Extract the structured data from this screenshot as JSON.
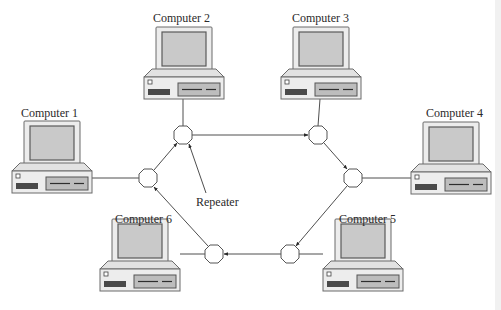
{
  "diagram": {
    "type": "ring-network",
    "computers": [
      {
        "id": 1,
        "label": "Computer 1",
        "x": 12,
        "y": 121,
        "label_x": 50,
        "label_y": 116
      },
      {
        "id": 2,
        "label": "Computer 2",
        "x": 144,
        "y": 27,
        "label_x": 184,
        "label_y": 21
      },
      {
        "id": 3,
        "label": "Computer 3",
        "x": 281,
        "y": 27,
        "label_x": 321,
        "label_y": 21
      },
      {
        "id": 4,
        "label": "Computer 4",
        "x": 411,
        "y": 122,
        "label_x": 451,
        "label_y": 116
      },
      {
        "id": 5,
        "label": "Computer 5",
        "x": 323,
        "y": 219,
        "label_x": 363,
        "label_y": 213
      },
      {
        "id": 6,
        "label": "Computer 6",
        "x": 100,
        "y": 219,
        "label_x": 140,
        "label_y": 213
      }
    ],
    "repeaters": [
      {
        "id": "R1",
        "cx": 148,
        "cy": 178
      },
      {
        "id": "R2",
        "cx": 183,
        "cy": 135
      },
      {
        "id": "R3",
        "cx": 318,
        "cy": 135
      },
      {
        "id": "R4",
        "cx": 353,
        "cy": 178
      },
      {
        "id": "R5",
        "cx": 290,
        "cy": 254
      },
      {
        "id": "R6",
        "cx": 214,
        "cy": 254
      }
    ],
    "ring_direction": [
      "R1",
      "R2",
      "R3",
      "R4",
      "R5",
      "R6",
      "R1"
    ],
    "callout": {
      "label": "Repeater",
      "x": 214,
      "y": 202
    }
  },
  "labels": {
    "computer_1": "Computer 1",
    "computer_2": "Computer 2",
    "computer_3": "Computer 3",
    "computer_4": "Computer 4",
    "computer_5": "Computer 5",
    "computer_6": "Computer 6",
    "repeater": "Repeater"
  },
  "colors": {
    "line": "#3a3a3a",
    "screen": "#c9c9c9",
    "case": "#ececec",
    "background": "#ffffff"
  }
}
